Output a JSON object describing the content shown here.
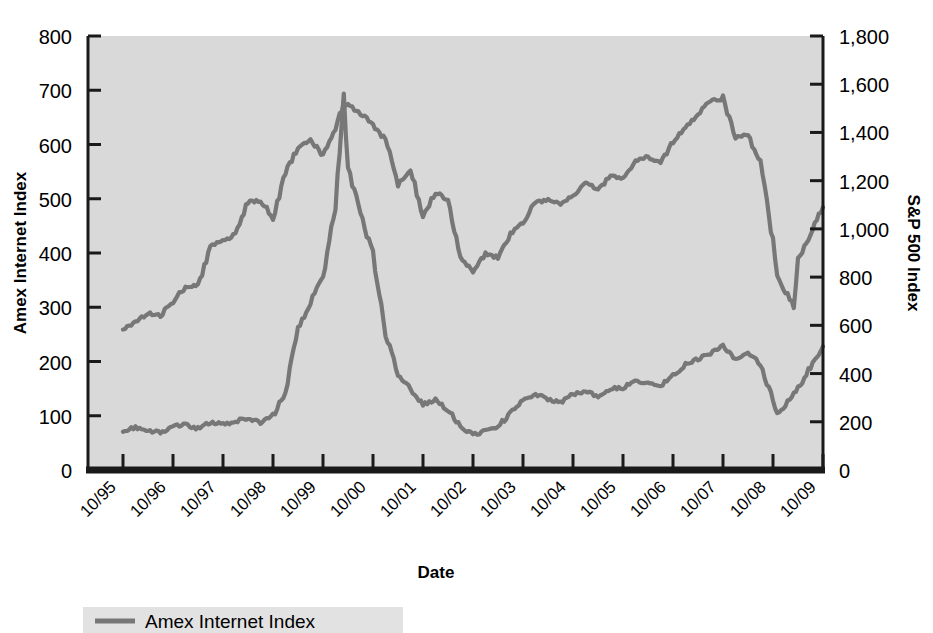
{
  "chart_data": {
    "type": "line",
    "title": "",
    "xlabel": "Date",
    "ylabel": "Amex Internet Index",
    "y2label": "S&P 500 Index",
    "grid": false,
    "legend_position": "bottom-left",
    "x_tick_labels": [
      "10/95",
      "10/96",
      "10/97",
      "10/98",
      "10/99",
      "10/00",
      "10/01",
      "10/02",
      "10/03",
      "10/04",
      "10/05",
      "10/06",
      "10/07",
      "10/08",
      "10/09"
    ],
    "y_tick_labels": [
      "0",
      "100",
      "200",
      "300",
      "400",
      "500",
      "600",
      "700",
      "800"
    ],
    "y2_tick_labels": [
      "0",
      "200",
      "400",
      "600",
      "800",
      "1,000",
      "1,200",
      "1,400",
      "1,600",
      "1,800"
    ],
    "ylim": [
      0,
      800
    ],
    "y2lim": [
      0,
      1800
    ],
    "xlim": [
      "10/95",
      "10/09"
    ],
    "colors": {
      "plot_background": "#d9d9d9",
      "series_line": "#777777",
      "axis": "#1a1a1a",
      "page_background": "#ffffff"
    },
    "series": [
      {
        "name": "Amex Internet Index",
        "axis": "left",
        "color": "#777777",
        "x": [
          "10/95",
          "01/96",
          "04/96",
          "07/96",
          "10/96",
          "01/97",
          "04/97",
          "07/97",
          "10/97",
          "01/98",
          "04/98",
          "07/98",
          "10/98",
          "01/99",
          "04/99",
          "07/99",
          "10/99",
          "01/00",
          "03/00",
          "04/00",
          "07/00",
          "10/00",
          "01/01",
          "04/01",
          "07/01",
          "10/01",
          "01/02",
          "04/02",
          "07/02",
          "10/02",
          "01/03",
          "04/03",
          "07/03",
          "10/03",
          "01/04",
          "04/04",
          "07/04",
          "10/04",
          "01/05",
          "04/05",
          "07/05",
          "10/05",
          "01/06",
          "04/06",
          "07/06",
          "10/06",
          "01/07",
          "04/07",
          "07/07",
          "10/07",
          "01/08",
          "04/08",
          "07/08",
          "10/08",
          "11/08",
          "01/09",
          "04/09",
          "07/09",
          "10/09"
        ],
        "y": [
          72,
          78,
          72,
          70,
          80,
          84,
          76,
          88,
          84,
          90,
          96,
          88,
          100,
          145,
          260,
          310,
          355,
          490,
          688,
          560,
          470,
          400,
          250,
          175,
          150,
          120,
          130,
          110,
          80,
          65,
          72,
          80,
          105,
          130,
          140,
          130,
          125,
          140,
          145,
          135,
          150,
          152,
          165,
          160,
          155,
          175,
          195,
          205,
          215,
          230,
          205,
          215,
          195,
          130,
          105,
          120,
          150,
          190,
          228
        ]
      },
      {
        "name": "S&P 500 Index",
        "axis": "right",
        "color": "#777777",
        "x": [
          "10/95",
          "01/96",
          "04/96",
          "07/96",
          "10/96",
          "01/97",
          "04/97",
          "07/97",
          "10/97",
          "01/98",
          "04/98",
          "07/98",
          "10/98",
          "01/99",
          "04/99",
          "07/99",
          "10/99",
          "01/00",
          "03/00",
          "07/00",
          "10/00",
          "01/01",
          "04/01",
          "07/01",
          "10/01",
          "01/02",
          "04/02",
          "07/02",
          "10/02",
          "01/03",
          "04/03",
          "07/03",
          "10/03",
          "01/04",
          "04/04",
          "07/04",
          "10/04",
          "01/05",
          "04/05",
          "07/05",
          "10/05",
          "01/06",
          "04/06",
          "07/06",
          "10/06",
          "01/07",
          "04/07",
          "07/07",
          "10/07",
          "01/08",
          "04/08",
          "07/08",
          "10/08",
          "11/08",
          "03/09",
          "04/09",
          "07/09",
          "10/09"
        ],
        "y": [
          585,
          615,
          650,
          640,
          700,
          760,
          765,
          925,
          950,
          980,
          1110,
          1120,
          1050,
          1230,
          1340,
          1370,
          1300,
          1420,
          1520,
          1480,
          1430,
          1370,
          1180,
          1250,
          1050,
          1150,
          1120,
          890,
          820,
          900,
          880,
          980,
          1030,
          1110,
          1120,
          1100,
          1140,
          1190,
          1160,
          1220,
          1210,
          1280,
          1300,
          1270,
          1360,
          1420,
          1480,
          1530,
          1540,
          1380,
          1390,
          1270,
          950,
          800,
          680,
          870,
          980,
          1090
        ]
      }
    ]
  },
  "legend": {
    "items": [
      {
        "label": "Amex Internet Index",
        "color": "#777777"
      }
    ]
  },
  "axes": {
    "left_title": "Amex Internet Index",
    "right_title": "S&P 500 Index",
    "bottom_title": "Date"
  }
}
